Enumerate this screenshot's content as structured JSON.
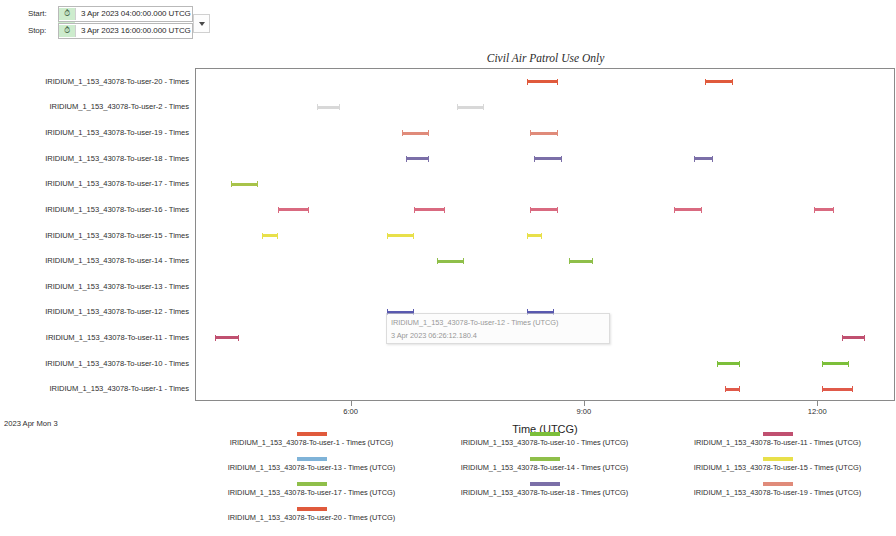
{
  "time_controls": {
    "start_label": "Start:",
    "stop_label": "Stop:",
    "start_value": "3 Apr 2023 04:00:00.000 UTCG",
    "stop_value": "3 Apr 2023 16:00:00.000 UTCG",
    "clock_icon": "clock-icon",
    "dropdown_icon": "chevron-down-icon"
  },
  "chart_data": {
    "type": "bar",
    "title": "Civil Air Patrol Use Only",
    "xlabel": "Time (UTCG)",
    "ylabel": "",
    "date_stamp": "2023 Apr Mon 3",
    "grid": false,
    "legend_position": "bottom",
    "xlim": [
      "04:00",
      "13:00"
    ],
    "xticks": [
      "6:00",
      "9:00",
      "12:00"
    ],
    "xtick_values": [
      6,
      9,
      12
    ],
    "categories": [
      "IRIDIUM_1_153_43078-To-user-20 - Times",
      "IRIDIUM_1_153_43078-To-user-2 - Times",
      "IRIDIUM_1_153_43078-To-user-19 - Times",
      "IRIDIUM_1_153_43078-To-user-18 - Times",
      "IRIDIUM_1_153_43078-To-user-17 - Times",
      "IRIDIUM_1_153_43078-To-user-16 - Times",
      "IRIDIUM_1_153_43078-To-user-15 - Times",
      "IRIDIUM_1_153_43078-To-user-14 - Times",
      "IRIDIUM_1_153_43078-To-user-13 - Times",
      "IRIDIUM_1_153_43078-To-user-12 - Times",
      "IRIDIUM_1_153_43078-To-user-11 - Times",
      "IRIDIUM_1_153_43078-To-user-10 - Times",
      "IRIDIUM_1_153_43078-To-user-1 - Times"
    ],
    "series": [
      {
        "name": "IRIDIUM_1_153_43078-To-user-20 - Times (UTCG)",
        "row": 0,
        "color": "#e05a3c",
        "intervals": [
          [
            8.25,
            8.65
          ],
          [
            10.55,
            10.9
          ]
        ]
      },
      {
        "name": "IRIDIUM_1_153_43078-To-user-2 - Times",
        "row": 1,
        "color": "#d8d8d8",
        "intervals": [
          [
            5.55,
            5.85
          ],
          [
            7.35,
            7.7
          ]
        ]
      },
      {
        "name": "IRIDIUM_1_153_43078-To-user-19 - Times (UTCG)",
        "row": 2,
        "color": "#e08b7a",
        "intervals": [
          [
            6.65,
            7.0
          ],
          [
            8.3,
            8.65
          ]
        ]
      },
      {
        "name": "IRIDIUM_1_153_43078-To-user-18 - Times (UTCG)",
        "row": 3,
        "color": "#7b6fa8",
        "intervals": [
          [
            6.7,
            7.0
          ],
          [
            8.35,
            8.7
          ],
          [
            10.4,
            10.65
          ]
        ]
      },
      {
        "name": "IRIDIUM_1_153_43078-To-user-17 - Times (UTCG)",
        "row": 4,
        "color": "#a8c34a",
        "intervals": [
          [
            4.45,
            4.8
          ]
        ]
      },
      {
        "name": "IRIDIUM_1_153_43078-To-user-16 - Times",
        "row": 5,
        "color": "#d96a80",
        "intervals": [
          [
            5.05,
            5.45
          ],
          [
            6.8,
            7.2
          ],
          [
            8.3,
            8.65
          ],
          [
            10.15,
            10.5
          ],
          [
            11.95,
            12.2
          ]
        ]
      },
      {
        "name": "IRIDIUM_1_153_43078-To-user-15 - Times (UTCG)",
        "row": 6,
        "color": "#e8e04a",
        "intervals": [
          [
            4.85,
            5.05
          ],
          [
            6.45,
            6.8
          ],
          [
            8.25,
            8.45
          ]
        ]
      },
      {
        "name": "IRIDIUM_1_153_43078-To-user-14 - Times (UTCG)",
        "row": 7,
        "color": "#8fbf4a",
        "intervals": [
          [
            7.1,
            7.45
          ],
          [
            8.8,
            9.1
          ]
        ]
      },
      {
        "name": "IRIDIUM_1_153_43078-To-user-13 - Times (UTCG)",
        "row": 8,
        "color": "#7fb3d8",
        "intervals": []
      },
      {
        "name": "IRIDIUM_1_153_43078-To-user-12 - Times (UTCG)",
        "row": 9,
        "color": "#5a5ab0",
        "intervals": [
          [
            6.45,
            6.8
          ],
          [
            8.25,
            8.6
          ]
        ]
      },
      {
        "name": "IRIDIUM_1_153_43078-To-user-11 - Times (UTCG)",
        "row": 10,
        "color": "#c05070",
        "intervals": [
          [
            4.25,
            4.55
          ],
          [
            12.3,
            12.6
          ]
        ]
      },
      {
        "name": "IRIDIUM_1_153_43078-To-user-10 - Times (UTCG)",
        "row": 11,
        "color": "#7cbf3a",
        "intervals": [
          [
            10.7,
            11.0
          ],
          [
            12.05,
            12.4
          ]
        ]
      },
      {
        "name": "IRIDIUM_1_153_43078-To-user-1 - Times (UTCG)",
        "row": 12,
        "color": "#e05a4a",
        "intervals": [
          [
            10.8,
            11.0
          ],
          [
            12.05,
            12.45
          ]
        ]
      }
    ]
  },
  "tooltip": {
    "line1": "IRIDIUM_1_153_43078-To-user-12 - Times (UTCG)",
    "line2": "3 Apr 2023 06:26:12.180.4"
  },
  "legend": {
    "columns": [
      [
        {
          "label": "IRIDIUM_1_153_43078-To-user-1 - Times (UTCG)",
          "color": "#e05a3c"
        },
        {
          "label": "IRIDIUM_1_153_43078-To-user-13 - Times (UTCG)",
          "color": "#7fb3d8"
        },
        {
          "label": "IRIDIUM_1_153_43078-To-user-17 - Times (UTCG)",
          "color": "#8fbf4a"
        },
        {
          "label": "IRIDIUM_1_153_43078-To-user-20 - Times (UTCG)",
          "color": "#e05a3c"
        }
      ],
      [
        {
          "label": "IRIDIUM_1_153_43078-To-user-10 - Times (UTCG)",
          "color": "#7cbf3a"
        },
        {
          "label": "IRIDIUM_1_153_43078-To-user-14 - Times (UTCG)",
          "color": "#8fbf4a"
        },
        {
          "label": "IRIDIUM_1_153_43078-To-user-18 - Times (UTCG)",
          "color": "#7b6fa8"
        }
      ],
      [
        {
          "label": "IRIDIUM_1_153_43078-To-user-11 - Times (UTCG)",
          "color": "#c05070"
        },
        {
          "label": "IRIDIUM_1_153_43078-To-user-15 - Times (UTCG)",
          "color": "#e8e04a"
        },
        {
          "label": "IRIDIUM_1_153_43078-To-user-19 - Times (UTCG)",
          "color": "#e08b7a"
        }
      ]
    ]
  }
}
